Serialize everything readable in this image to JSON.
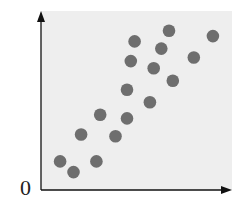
{
  "chart_data": {
    "type": "scatter",
    "title": "",
    "xlabel": "",
    "ylabel": "",
    "origin_label": "0",
    "grid": false,
    "legend": null,
    "xlim": [
      0,
      10
    ],
    "ylim": [
      0,
      10
    ],
    "points": [
      {
        "x": 1.0,
        "y": 1.6
      },
      {
        "x": 1.7,
        "y": 1.0
      },
      {
        "x": 2.1,
        "y": 3.1
      },
      {
        "x": 2.9,
        "y": 1.6
      },
      {
        "x": 3.1,
        "y": 4.2
      },
      {
        "x": 3.9,
        "y": 3.0
      },
      {
        "x": 4.5,
        "y": 5.6
      },
      {
        "x": 4.5,
        "y": 4.0
      },
      {
        "x": 4.7,
        "y": 7.2
      },
      {
        "x": 4.9,
        "y": 8.3
      },
      {
        "x": 5.7,
        "y": 4.9
      },
      {
        "x": 5.9,
        "y": 6.8
      },
      {
        "x": 6.3,
        "y": 7.9
      },
      {
        "x": 6.7,
        "y": 8.9
      },
      {
        "x": 6.9,
        "y": 6.1
      },
      {
        "x": 8.0,
        "y": 7.4
      },
      {
        "x": 9.0,
        "y": 8.6
      }
    ],
    "colors": {
      "background": "#eeeeee",
      "point": "#6e6e6e",
      "axis": "#111111"
    }
  }
}
